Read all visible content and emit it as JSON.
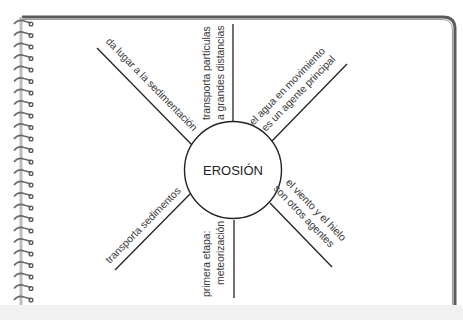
{
  "diagram": {
    "type": "spider_map",
    "center": {
      "label": "EROSIÓN"
    },
    "branches": [
      {
        "id": "upper-left",
        "lines": [
          "da lugar a la sedimentación"
        ]
      },
      {
        "id": "top",
        "lines": [
          "transporta partículas",
          "a grandes distancias"
        ]
      },
      {
        "id": "upper-right",
        "lines": [
          "el agua en movimiento",
          "es un agente principal"
        ]
      },
      {
        "id": "lower-left",
        "lines": [
          "transporta sedimentos"
        ]
      },
      {
        "id": "bottom",
        "lines": [
          "primera etapa:",
          "meteorización"
        ]
      },
      {
        "id": "lower-right",
        "lines": [
          "el viento y el hielo",
          "son otros agentes"
        ]
      }
    ]
  },
  "colors": {
    "line": "#222222",
    "text": "#3a3a3a",
    "border": "#555555",
    "spiral": "#6a6a6a",
    "band": "#f1f1f1"
  }
}
